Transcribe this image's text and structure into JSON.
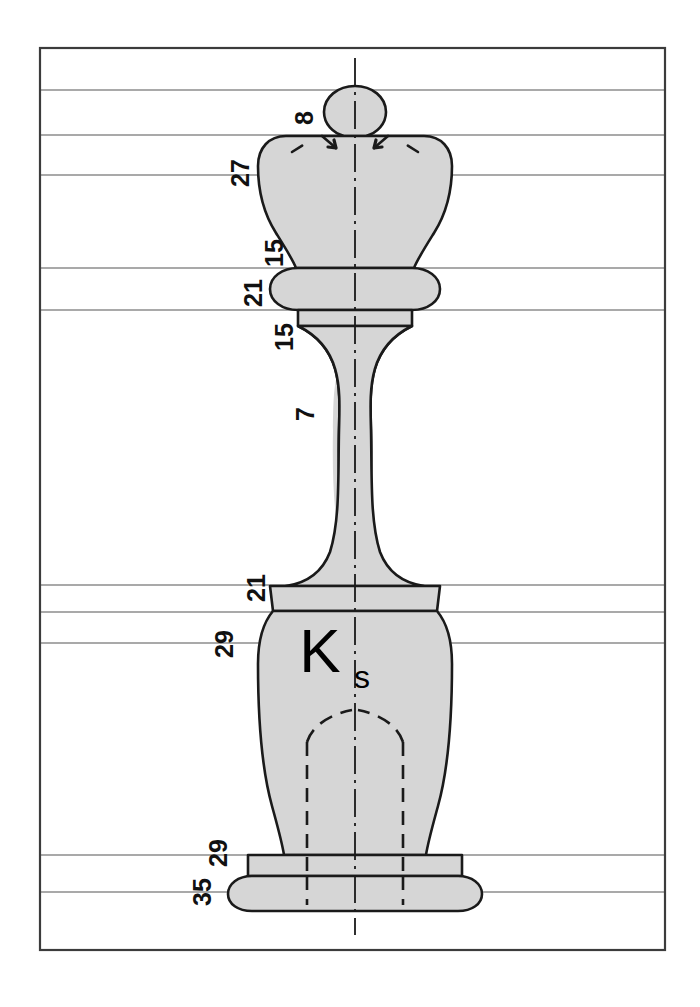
{
  "drawing": {
    "title": "Chess king piece technical drawing",
    "part_label": {
      "symbol": "K",
      "subscript": "s"
    },
    "colors": {
      "body_fill": "#d6d6d6",
      "outline": "#1a1a1a",
      "frame": "#3c3c3c",
      "grid_line": "#8d8d8d",
      "center_line": "#1a1a1a",
      "hidden_line": "#1a1a1a",
      "background": "#ffffff",
      "text": "#111111"
    },
    "frame": {
      "x": 40,
      "y": 48,
      "width": 625,
      "height": 902
    },
    "grid_lines_y": [
      90,
      135,
      175,
      268,
      310,
      585,
      612,
      643,
      855,
      892
    ],
    "dimensions": [
      {
        "id": "ball-diameter",
        "value": "8",
        "x": 313,
        "y": 118
      },
      {
        "id": "crown-width",
        "value": "27",
        "x": 249,
        "y": 173
      },
      {
        "id": "neck-upper",
        "value": "15",
        "x": 283,
        "y": 253
      },
      {
        "id": "collar-width",
        "value": "21",
        "x": 262,
        "y": 293
      },
      {
        "id": "neck-lower",
        "value": "15",
        "x": 293,
        "y": 337
      },
      {
        "id": "stem-width",
        "value": "7",
        "x": 314,
        "y": 414
      },
      {
        "id": "shoulder-width",
        "value": "21",
        "x": 265,
        "y": 588
      },
      {
        "id": "body-width",
        "value": "29",
        "x": 233,
        "y": 644
      },
      {
        "id": "plinth-width",
        "value": "29",
        "x": 227,
        "y": 853
      },
      {
        "id": "base-width",
        "value": "35",
        "x": 211,
        "y": 892
      }
    ]
  }
}
